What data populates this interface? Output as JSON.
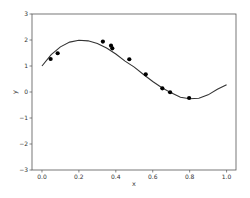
{
  "chart_data": {
    "type": "scatter",
    "title": "",
    "xlabel": "x",
    "ylabel": "y",
    "xlim": [
      -0.054,
      1.051
    ],
    "ylim": [
      -3,
      3
    ],
    "grid": false,
    "legend": null,
    "x_ticks": [
      0.0,
      0.2,
      0.4,
      0.6,
      0.8,
      1.0
    ],
    "x_tick_labels": [
      "0.0",
      "0.2",
      "0.4",
      "0.6",
      "0.8",
      "1.0"
    ],
    "y_ticks": [
      -3,
      -2,
      -1,
      0,
      1,
      2,
      3
    ],
    "y_tick_labels": [
      "−3",
      "−2",
      "−1",
      "0",
      "1",
      "2",
      "3"
    ],
    "series": [
      {
        "name": "data",
        "type": "scatter",
        "color": "#000000",
        "x": [
          0.047,
          0.085,
          0.33,
          0.374,
          0.381,
          0.473,
          0.562,
          0.652,
          0.694,
          0.797
        ],
        "y": [
          1.27,
          1.49,
          1.94,
          1.78,
          1.68,
          1.26,
          0.68,
          0.14,
          -0.01,
          -0.23
        ]
      },
      {
        "name": "fit",
        "type": "line",
        "color": "#333333",
        "x": [
          0.0,
          0.05,
          0.1,
          0.15,
          0.2,
          0.25,
          0.3,
          0.35,
          0.4,
          0.45,
          0.5,
          0.55,
          0.6,
          0.65,
          0.7,
          0.75,
          0.8,
          0.85,
          0.9,
          0.95,
          1.0
        ],
        "y": [
          1.0,
          1.437,
          1.736,
          1.919,
          1.99,
          1.968,
          1.864,
          1.69,
          1.46,
          1.188,
          0.958,
          0.672,
          0.405,
          0.167,
          -0.033,
          -0.205,
          -0.262,
          -0.238,
          -0.11,
          0.104,
          0.28
        ]
      }
    ]
  }
}
